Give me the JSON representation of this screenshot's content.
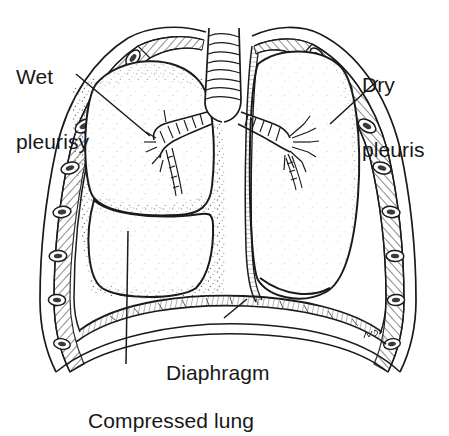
{
  "figure": {
    "background_color": "#ffffff",
    "ink_color": "#1a1a1a",
    "stipple_color": "#6b6b6b",
    "width": 449,
    "height": 408
  },
  "labels": [
    {
      "id": "wet-pleurisy",
      "line1": "Wet",
      "line2": "pleurisy",
      "text": "Wet pleurisy",
      "leader_from": [
        76,
        74
      ],
      "leader_to": [
        150,
        136
      ]
    },
    {
      "id": "dry-pleurisy",
      "line1": "Dry",
      "line2": "pleuris",
      "text": "Dry pleuris",
      "leader_from": [
        378,
        80
      ],
      "leader_to": [
        330,
        124
      ]
    },
    {
      "id": "diaphragm",
      "line1": "Diaphragm",
      "text": "Diaphragm",
      "leader_from": [
        224,
        318
      ],
      "leader_to": [
        247,
        299
      ]
    },
    {
      "id": "compressed-lung",
      "line1": "Compressed lung",
      "text": "Compressed lung",
      "leader_from": [
        126,
        364
      ],
      "leader_to": [
        128,
        231
      ]
    }
  ],
  "anatomy": {
    "parts": [
      {
        "name": "trachea",
        "note": "cartilage rings, midline"
      },
      {
        "name": "left-main-bronchus",
        "note": "branches to compressed lung"
      },
      {
        "name": "right-main-bronchus",
        "note": "branches to aerated lung"
      },
      {
        "name": "left-lung-compressed",
        "note": "collapsed by pleural fluid"
      },
      {
        "name": "right-lung",
        "note": "normally expanded"
      },
      {
        "name": "diaphragm",
        "note": "dome spanning thoracic base"
      },
      {
        "name": "chest-wall",
        "note": "hatched intercostal muscle"
      },
      {
        "name": "ribs",
        "note": "oval cross-sections along chest wall"
      },
      {
        "name": "pleural-effusion",
        "note": "stippled fluid, left side"
      },
      {
        "name": "dry-pleura",
        "note": "thickened roughened pleura, right side"
      },
      {
        "name": "artist-signature",
        "note": "small monogram lower right"
      }
    ]
  }
}
